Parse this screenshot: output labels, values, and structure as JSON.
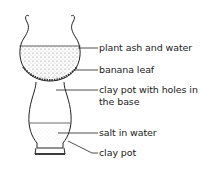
{
  "diagram": {
    "title": "",
    "labels": [
      {
        "id": "plant-ash",
        "text": "plant ash and water"
      },
      {
        "id": "banana-leaf",
        "text": "banana leaf"
      },
      {
        "id": "clay-pot-holes-line1",
        "text": "clay pot with holes in"
      },
      {
        "id": "clay-pot-holes-line2",
        "text": "the base"
      },
      {
        "id": "salt-water",
        "text": "salt in water"
      },
      {
        "id": "clay-pot",
        "text": "clay pot"
      }
    ]
  }
}
